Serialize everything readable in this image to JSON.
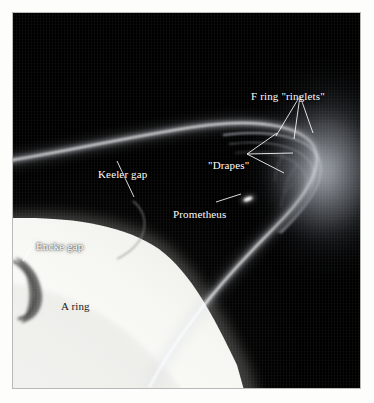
{
  "figure": {
    "kind": "annotated-astronomical-photograph",
    "background_color": "#000000",
    "page_color": "#fdfdfb",
    "frame_border_color": "#b9b9b9",
    "annotation_color": "#ffffff"
  },
  "annotations": [
    {
      "id": "f-ring-ringlets",
      "label": "F ring \"ringlets\"",
      "leader": "three-line-fan",
      "leader_count": 3,
      "text_color": "#ffffff",
      "anchor": {
        "x": 300,
        "y": 96
      },
      "targets": [
        {
          "x": 276,
          "y": 136
        },
        {
          "x": 294,
          "y": 139
        },
        {
          "x": 313,
          "y": 133
        }
      ]
    },
    {
      "id": "drapes",
      "label": "\"Drapes\"",
      "leader": "three-line-fan",
      "leader_count": 3,
      "text_color": "#ffffff",
      "anchor": {
        "x": 247,
        "y": 154
      },
      "targets": [
        {
          "x": 277,
          "y": 133
        },
        {
          "x": 293,
          "y": 153
        },
        {
          "x": 284,
          "y": 173
        }
      ]
    },
    {
      "id": "keeler-gap",
      "label": "Keeler gap",
      "leader": "single-line",
      "leader_count": 1,
      "text_color": "#ffffff",
      "anchor": {
        "x": 117,
        "y": 161
      },
      "targets": [
        {
          "x": 133,
          "y": 196
        }
      ]
    },
    {
      "id": "prometheus",
      "label": "Prometheus",
      "leader": "single-arrow",
      "leader_count": 1,
      "text_color": "#ffffff",
      "anchor": {
        "x": 215,
        "y": 197
      },
      "targets": [
        {
          "x": 240,
          "y": 188
        }
      ]
    },
    {
      "id": "encke-gap",
      "label": "Encke gap",
      "leader": "single-line",
      "leader_count": 1,
      "text_color": "#ffffff",
      "anchor": {
        "x": 36,
        "y": 236
      },
      "targets": [
        {
          "x": 22,
          "y": 258
        }
      ]
    },
    {
      "id": "a-ring",
      "label": "A ring",
      "leader": "none",
      "leader_count": 0,
      "text_color": "#1a1a1a",
      "anchor": {
        "x": 62,
        "y": 292
      },
      "targets": []
    }
  ],
  "features": [
    {
      "id": "a-ring-body",
      "name": "A ring",
      "appearance": "broad bright band, lower left"
    },
    {
      "id": "f-ring-strand",
      "name": "F ring",
      "appearance": "thin bright strand arcing over the A ring"
    },
    {
      "id": "encke-gap-dark",
      "name": "Encke gap",
      "appearance": "dark crescent notch at left edge of A ring"
    },
    {
      "id": "keeler-gap-dark",
      "name": "Keeler gap",
      "appearance": "thin dark line near outer A ring edge"
    },
    {
      "id": "prometheus-moon",
      "name": "Prometheus",
      "appearance": "small elongated bright dot inside the ring gap"
    },
    {
      "id": "limb-haze",
      "name": "forward-scattered haze",
      "appearance": "diffuse glow at right limb"
    }
  ]
}
